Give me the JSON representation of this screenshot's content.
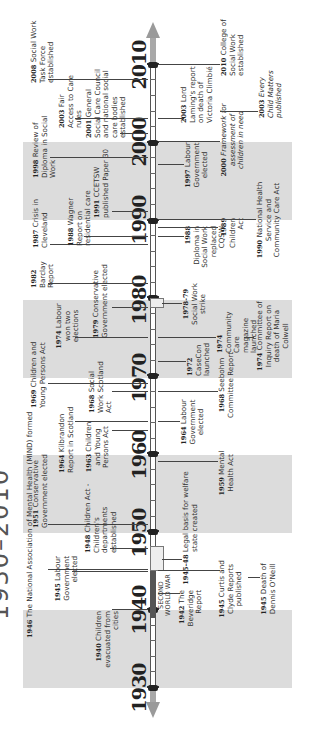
{
  "title": "1930–2010",
  "axis": {
    "start_year": 1930,
    "end_year": 2010,
    "decade_labels": [
      "1930",
      "1940",
      "1950",
      "1960",
      "1970",
      "1980",
      "1990",
      "2000",
      "2010"
    ],
    "shaded_decades": [
      "1930-1940",
      "1950-1960",
      "1970-1980",
      "1990-2000"
    ],
    "period_marker": {
      "label": "SECOND WORLD WAR",
      "from": 1939,
      "to": 1945
    }
  },
  "colors": {
    "band": "#dcdcdc",
    "axis_arrow": "#9a9a9a",
    "text": "#333333"
  },
  "events_above": [
    {
      "year_label": "1946",
      "text": "The National Association of Mental Health (MIND) formed"
    },
    {
      "year_label": "1945",
      "text": "Labour Government elected"
    },
    {
      "year_label": "1940",
      "text": "Children evacuated from cities"
    },
    {
      "year_label": "1951",
      "text": "Conservative Government elected"
    },
    {
      "year_label": "1948",
      "text": "Children Act - Children's departments established"
    },
    {
      "year_label": "1964",
      "text": "Kilbrandon Report in Scotland"
    },
    {
      "year_label": "1963",
      "text": "Children and Young Persons Act"
    },
    {
      "year_label": "1969",
      "text": "Children and Young Persons Act"
    },
    {
      "year_label": "1968",
      "text": "Social Work Scotland Act"
    },
    {
      "year_label": "1974",
      "text": "Labour won two elections"
    },
    {
      "year_label": "1982",
      "text": "Barclay Report"
    },
    {
      "year_label": "1979",
      "text": "Conservative Government elected"
    },
    {
      "year_label": "1987",
      "text": "Crisis in Cleveland"
    },
    {
      "year_label": "1988",
      "text": "Wagner Report on residential care"
    },
    {
      "year_label": "1991",
      "text": "CCETSW published Paper 30"
    },
    {
      "year_label": "1998",
      "text": "Review of Diploma in Social Work"
    },
    {
      "year_label": "2003",
      "text": "Fair Access to Care rules"
    },
    {
      "year_label": "2001",
      "text": "General Social Care Council and national social care bodies established"
    },
    {
      "year_label": "2008",
      "text": "Social Work Task Force established"
    }
  ],
  "events_below": [
    {
      "year_label": "1942",
      "text": "The Beveridge Report"
    },
    {
      "year_label": "1945-48",
      "text": "Legal basis for welfare state created"
    },
    {
      "year_label": "1945",
      "text": "Curtis and Clyde Reports published"
    },
    {
      "year_label": "1945",
      "text": "Death of Dennis O'Neill"
    },
    {
      "year_label": "1959",
      "text": "Mental Health Act"
    },
    {
      "year_label": "1964",
      "text": "Labour Government elected"
    },
    {
      "year_label": "1968",
      "text": "Seebohm Committee Report"
    },
    {
      "year_label": "1972",
      "text": "CaseCon launched"
    },
    {
      "year_label": "1978-79",
      "text": "Social Work strike"
    },
    {
      "year_label": "1974",
      "text": "Community Care magazine launched"
    },
    {
      "year_label": "1974",
      "text": "Committee of Inquiry Report on death of Maria Colwell"
    },
    {
      "year_label": "1988",
      "text": "Diploma in Social Work replaced CQSW"
    },
    {
      "year_label": "1989",
      "text": "Children Act"
    },
    {
      "year_label": "1990",
      "text": "National Health Service and Community Care Act"
    },
    {
      "year_label": "1997",
      "text": "Labour Government elected"
    },
    {
      "year_label": "2000",
      "text": "Framework for assessment of children in need"
    },
    {
      "year_label": "2003",
      "text": "Lord Laming's report on death of Victoria Climbié"
    },
    {
      "year_label": "2003",
      "text": "Every Child Matters published"
    },
    {
      "year_label": "2010",
      "text": "College of Social Work established"
    }
  ]
}
